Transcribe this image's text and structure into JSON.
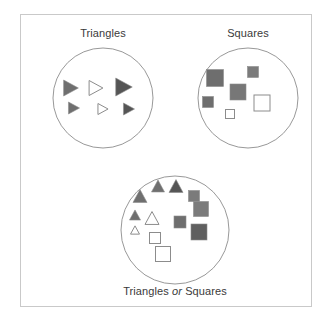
{
  "figure": {
    "title_top_left": "Triangles",
    "title_top_right": "Squares",
    "title_bottom_prefix": "Triangles",
    "title_bottom_conjunction": "or",
    "title_bottom_suffix": "Squares",
    "background_color": "#ffffff",
    "frame_color": "#c9c9c9",
    "circle_stroke_color": "#8c8c8c",
    "shape_outline_color": "#8c8c8c",
    "label_color": "#3a3a3a"
  },
  "chart_data": {
    "type": "diagram",
    "diagram_kind": "set-venn-union",
    "title": "Triangles or Squares",
    "sets": [
      {
        "name": "Triangles",
        "label": "Triangles",
        "circle": {
          "cx": 103,
          "cy": 98,
          "r": 50
        },
        "members": [
          {
            "shape": "triangle-right",
            "fill": "#6f6f6f",
            "size": 16,
            "x": 71,
            "y": 88
          },
          {
            "shape": "triangle-right",
            "fill": "#ffffff",
            "size": 15,
            "x": 96,
            "y": 88
          },
          {
            "shape": "triangle-right",
            "fill": "#555555",
            "size": 18,
            "x": 124,
            "y": 87
          },
          {
            "shape": "triangle-right",
            "fill": "#6f6f6f",
            "size": 12,
            "x": 74,
            "y": 108
          },
          {
            "shape": "triangle-right",
            "fill": "#ffffff",
            "size": 11,
            "x": 103,
            "y": 109
          },
          {
            "shape": "triangle-right",
            "fill": "#555555",
            "size": 12,
            "x": 129,
            "y": 109
          }
        ]
      },
      {
        "name": "Squares",
        "label": "Squares",
        "circle": {
          "cx": 248,
          "cy": 98,
          "r": 50
        },
        "members": [
          {
            "shape": "square",
            "fill": "#6e6e6e",
            "size": 17,
            "x": 215,
            "y": 78
          },
          {
            "shape": "square",
            "fill": "#7b7b7b",
            "size": 11,
            "x": 253,
            "y": 72
          },
          {
            "shape": "square",
            "fill": "#777777",
            "size": 16,
            "x": 238,
            "y": 92
          },
          {
            "shape": "square",
            "fill": "#6e6e6e",
            "size": 11,
            "x": 208,
            "y": 102
          },
          {
            "shape": "square",
            "fill": "#ffffff",
            "size": 9,
            "x": 230,
            "y": 114
          },
          {
            "shape": "square",
            "fill": "#ffffff",
            "size": 16,
            "x": 262,
            "y": 103
          }
        ]
      }
    ],
    "union": {
      "name": "TrianglesOrSquares",
      "label": "Triangles or Squares",
      "circle": {
        "cx": 175,
        "cy": 230,
        "r": 54
      },
      "members": [
        {
          "shape": "triangle-up",
          "fill": "#6f6f6f",
          "size": 13,
          "x": 158,
          "y": 186
        },
        {
          "shape": "triangle-up",
          "fill": "#555555",
          "size": 14,
          "x": 176,
          "y": 186
        },
        {
          "shape": "triangle-up",
          "fill": "#6f6f6f",
          "size": 14,
          "x": 140,
          "y": 196
        },
        {
          "shape": "square",
          "fill": "#7b7b7b",
          "size": 11,
          "x": 194,
          "y": 196
        },
        {
          "shape": "triangle-up",
          "fill": "#6f6f6f",
          "size": 11,
          "x": 135,
          "y": 215
        },
        {
          "shape": "square",
          "fill": "#7b7b7b",
          "size": 15,
          "x": 201,
          "y": 209
        },
        {
          "shape": "triangle-up",
          "fill": "#ffffff",
          "size": 14,
          "x": 152,
          "y": 218
        },
        {
          "shape": "square",
          "fill": "#6e6e6e",
          "size": 12,
          "x": 180,
          "y": 222
        },
        {
          "shape": "triangle-up",
          "fill": "#ffffff",
          "size": 9,
          "x": 135,
          "y": 230
        },
        {
          "shape": "square",
          "fill": "#ffffff",
          "size": 11,
          "x": 155,
          "y": 238
        },
        {
          "shape": "square",
          "fill": "#5f5f5f",
          "size": 16,
          "x": 199,
          "y": 232
        },
        {
          "shape": "square",
          "fill": "#ffffff",
          "size": 15,
          "x": 163,
          "y": 254
        }
      ]
    }
  }
}
